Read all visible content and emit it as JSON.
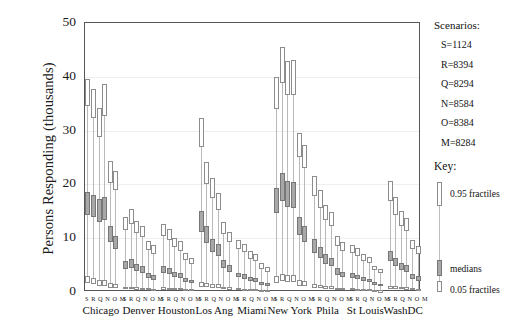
{
  "chart_data": {
    "type": "box",
    "title": "",
    "xlabel": "",
    "ylabel": "Persons Responding (thousands)",
    "ylim": [
      0,
      50
    ],
    "yticks": [
      0,
      10,
      20,
      30,
      40,
      50
    ],
    "grid": true,
    "legend_position": "right",
    "categories": [
      "Chicago",
      "Denver",
      "Houston",
      "Los Ang",
      "Miami",
      "New York",
      "Phila",
      "St Louis",
      "WashDC"
    ],
    "scenario_order": [
      "S",
      "R",
      "Q",
      "N",
      "O",
      "M"
    ],
    "scenario_label_text": "S R Q N O M",
    "groups": [
      {
        "city": "Chicago",
        "bars": [
          {
            "scenario": "S",
            "p05": 1.6,
            "median": 16.5,
            "p95": 39.6,
            "q_lo": 34.5,
            "m_lo": 14.3,
            "m_hi": 18.6,
            "p05_hi": 2.9
          },
          {
            "scenario": "R",
            "p05": 1.4,
            "median": 16.0,
            "p95": 37.8,
            "q_lo": 32.4,
            "m_lo": 14.0,
            "m_hi": 18.1,
            "p05_hi": 2.6
          },
          {
            "scenario": "Q",
            "p05": 1.2,
            "median": 15.2,
            "p95": 34.2,
            "q_lo": 28.9,
            "m_lo": 13.0,
            "m_hi": 17.3,
            "p05_hi": 2.3
          },
          {
            "scenario": "N",
            "p05": 1.1,
            "median": 15.6,
            "p95": 38.6,
            "q_lo": 32.7,
            "m_lo": 13.4,
            "m_hi": 17.6,
            "p05_hi": 2.2
          },
          {
            "scenario": "O",
            "p05": 0.8,
            "median": 10.6,
            "p95": 24.3,
            "q_lo": 20.2,
            "m_lo": 9.2,
            "m_hi": 12.2,
            "p05_hi": 1.7
          },
          {
            "scenario": "M",
            "p05": 0.7,
            "median": 9.0,
            "p95": 22.4,
            "q_lo": 19.0,
            "m_lo": 7.9,
            "m_hi": 10.4,
            "p05_hi": 1.5
          }
        ]
      },
      {
        "city": "Denver",
        "bars": [
          {
            "scenario": "S",
            "p05": 0.5,
            "median": 5.0,
            "p95": 14.0,
            "q_lo": 11.5,
            "m_lo": 4.2,
            "m_hi": 5.8,
            "p05_hi": 1.0
          },
          {
            "scenario": "R",
            "p05": 0.5,
            "median": 5.3,
            "p95": 15.4,
            "q_lo": 12.6,
            "m_lo": 4.5,
            "m_hi": 6.1,
            "p05_hi": 1.0
          },
          {
            "scenario": "Q",
            "p05": 0.4,
            "median": 4.5,
            "p95": 13.2,
            "q_lo": 10.9,
            "m_lo": 3.9,
            "m_hi": 5.2,
            "p05_hi": 0.9
          },
          {
            "scenario": "N",
            "p05": 0.4,
            "median": 4.1,
            "p95": 12.3,
            "q_lo": 10.2,
            "m_lo": 3.5,
            "m_hi": 4.8,
            "p05_hi": 0.8
          },
          {
            "scenario": "O",
            "p05": 0.3,
            "median": 3.0,
            "p95": 9.5,
            "q_lo": 7.8,
            "m_lo": 2.6,
            "m_hi": 3.5,
            "p05_hi": 0.7
          },
          {
            "scenario": "M",
            "p05": 0.3,
            "median": 2.7,
            "p95": 8.7,
            "q_lo": 7.1,
            "m_lo": 2.3,
            "m_hi": 3.1,
            "p05_hi": 0.6
          }
        ]
      },
      {
        "city": "Houston",
        "bars": [
          {
            "scenario": "S",
            "p05": 0.4,
            "median": 4.2,
            "p95": 12.6,
            "q_lo": 10.4,
            "m_lo": 3.6,
            "m_hi": 4.9,
            "p05_hi": 0.9
          },
          {
            "scenario": "R",
            "p05": 0.4,
            "median": 3.9,
            "p95": 11.8,
            "q_lo": 9.7,
            "m_lo": 3.3,
            "m_hi": 4.5,
            "p05_hi": 0.8
          },
          {
            "scenario": "Q",
            "p05": 0.3,
            "median": 3.3,
            "p95": 10.1,
            "q_lo": 8.3,
            "m_lo": 2.8,
            "m_hi": 3.8,
            "p05_hi": 0.7
          },
          {
            "scenario": "N",
            "p05": 0.3,
            "median": 3.0,
            "p95": 9.4,
            "q_lo": 7.7,
            "m_lo": 2.6,
            "m_hi": 3.5,
            "p05_hi": 0.7
          },
          {
            "scenario": "O",
            "p05": 0.2,
            "median": 2.2,
            "p95": 7.2,
            "q_lo": 5.9,
            "m_lo": 1.9,
            "m_hi": 2.6,
            "p05_hi": 0.5
          },
          {
            "scenario": "M",
            "p05": 0.2,
            "median": 1.9,
            "p95": 6.4,
            "q_lo": 5.2,
            "m_lo": 1.6,
            "m_hi": 2.2,
            "p05_hi": 0.5
          }
        ]
      },
      {
        "city": "Los Ang",
        "bars": [
          {
            "scenario": "S",
            "p05": 1.0,
            "median": 13.0,
            "p95": 32.3,
            "q_lo": 27.0,
            "m_lo": 11.2,
            "m_hi": 15.0,
            "p05_hi": 1.9
          },
          {
            "scenario": "R",
            "p05": 0.9,
            "median": 10.6,
            "p95": 24.2,
            "q_lo": 20.1,
            "m_lo": 9.1,
            "m_hi": 12.2,
            "p05_hi": 1.7
          },
          {
            "scenario": "Q",
            "p05": 0.8,
            "median": 8.6,
            "p95": 21.1,
            "q_lo": 17.5,
            "m_lo": 7.4,
            "m_hi": 9.9,
            "p05_hi": 1.5
          },
          {
            "scenario": "N",
            "p05": 0.7,
            "median": 7.8,
            "p95": 18.4,
            "q_lo": 15.2,
            "m_lo": 6.7,
            "m_hi": 9.0,
            "p05_hi": 1.4
          },
          {
            "scenario": "O",
            "p05": 0.5,
            "median": 5.2,
            "p95": 13.0,
            "q_lo": 10.7,
            "m_lo": 4.4,
            "m_hi": 6.0,
            "p05_hi": 1.0
          },
          {
            "scenario": "M",
            "p05": 0.4,
            "median": 4.4,
            "p95": 11.2,
            "q_lo": 9.2,
            "m_lo": 3.8,
            "m_hi": 5.1,
            "p05_hi": 0.9
          }
        ]
      },
      {
        "city": "Miami",
        "bars": [
          {
            "scenario": "S",
            "p05": 0.3,
            "median": 3.1,
            "p95": 9.6,
            "q_lo": 7.9,
            "m_lo": 2.7,
            "m_hi": 3.6,
            "p05_hi": 0.7
          },
          {
            "scenario": "R",
            "p05": 0.3,
            "median": 2.9,
            "p95": 9.0,
            "q_lo": 7.4,
            "m_lo": 2.5,
            "m_hi": 3.4,
            "p05_hi": 0.6
          },
          {
            "scenario": "Q",
            "p05": 0.2,
            "median": 2.4,
            "p95": 7.6,
            "q_lo": 6.2,
            "m_lo": 2.0,
            "m_hi": 2.8,
            "p05_hi": 0.6
          },
          {
            "scenario": "N",
            "p05": 0.2,
            "median": 2.2,
            "p95": 7.0,
            "q_lo": 5.7,
            "m_lo": 1.9,
            "m_hi": 2.6,
            "p05_hi": 0.5
          },
          {
            "scenario": "O",
            "p05": 0.2,
            "median": 1.6,
            "p95": 5.3,
            "q_lo": 4.3,
            "m_lo": 1.3,
            "m_hi": 1.9,
            "p05_hi": 0.4
          },
          {
            "scenario": "M",
            "p05": 0.1,
            "median": 1.4,
            "p95": 4.7,
            "q_lo": 3.8,
            "m_lo": 1.2,
            "m_hi": 1.7,
            "p05_hi": 0.4
          }
        ]
      },
      {
        "city": "New York",
        "bars": [
          {
            "scenario": "S",
            "p05": 1.7,
            "median": 17.0,
            "p95": 39.9,
            "q_lo": 34.0,
            "m_lo": 14.7,
            "m_hi": 19.3,
            "p05_hi": 3.0
          },
          {
            "scenario": "R",
            "p05": 2.0,
            "median": 19.6,
            "p95": 45.6,
            "q_lo": 38.9,
            "m_lo": 17.0,
            "m_hi": 22.2,
            "p05_hi": 3.4
          },
          {
            "scenario": "Q",
            "p05": 1.8,
            "median": 18.2,
            "p95": 43.0,
            "q_lo": 36.6,
            "m_lo": 15.8,
            "m_hi": 20.6,
            "p05_hi": 3.1
          },
          {
            "scenario": "N",
            "p05": 1.8,
            "median": 18.1,
            "p95": 43.1,
            "q_lo": 36.7,
            "m_lo": 15.7,
            "m_hi": 20.5,
            "p05_hi": 3.1
          },
          {
            "scenario": "O",
            "p05": 1.2,
            "median": 12.3,
            "p95": 29.6,
            "q_lo": 25.0,
            "m_lo": 10.6,
            "m_hi": 14.0,
            "p05_hi": 2.2
          },
          {
            "scenario": "M",
            "p05": 1.1,
            "median": 10.8,
            "p95": 27.4,
            "q_lo": 23.0,
            "m_lo": 9.3,
            "m_hi": 12.3,
            "p05_hi": 2.0
          }
        ]
      },
      {
        "city": "Phila",
        "bars": [
          {
            "scenario": "S",
            "p05": 0.8,
            "median": 8.5,
            "p95": 21.6,
            "q_lo": 17.8,
            "m_lo": 7.3,
            "m_hi": 9.8,
            "p05_hi": 1.5
          },
          {
            "scenario": "R",
            "p05": 0.7,
            "median": 7.3,
            "p95": 19.0,
            "q_lo": 15.6,
            "m_lo": 6.3,
            "m_hi": 8.4,
            "p05_hi": 1.3
          },
          {
            "scenario": "Q",
            "p05": 0.6,
            "median": 6.1,
            "p95": 16.2,
            "q_lo": 13.3,
            "m_lo": 5.2,
            "m_hi": 7.0,
            "p05_hi": 1.1
          },
          {
            "scenario": "N",
            "p05": 0.6,
            "median": 5.6,
            "p95": 14.9,
            "q_lo": 12.2,
            "m_lo": 4.8,
            "m_hi": 6.4,
            "p05_hi": 1.1
          },
          {
            "scenario": "O",
            "p05": 0.4,
            "median": 3.8,
            "p95": 10.5,
            "q_lo": 8.6,
            "m_lo": 3.2,
            "m_hi": 4.4,
            "p05_hi": 0.8
          },
          {
            "scenario": "M",
            "p05": 0.4,
            "median": 3.3,
            "p95": 9.3,
            "q_lo": 7.6,
            "m_lo": 2.8,
            "m_hi": 3.8,
            "p05_hi": 0.7
          }
        ]
      },
      {
        "city": "St Louis",
        "bars": [
          {
            "scenario": "S",
            "p05": 0.3,
            "median": 3.0,
            "p95": 8.8,
            "q_lo": 7.2,
            "m_lo": 2.6,
            "m_hi": 3.5,
            "p05_hi": 0.7
          },
          {
            "scenario": "R",
            "p05": 0.3,
            "median": 2.8,
            "p95": 8.2,
            "q_lo": 6.7,
            "m_lo": 2.4,
            "m_hi": 3.2,
            "p05_hi": 0.6
          },
          {
            "scenario": "Q",
            "p05": 0.2,
            "median": 2.3,
            "p95": 7.0,
            "q_lo": 5.7,
            "m_lo": 2.0,
            "m_hi": 2.7,
            "p05_hi": 0.5
          },
          {
            "scenario": "N",
            "p05": 0.2,
            "median": 2.1,
            "p95": 6.5,
            "q_lo": 5.3,
            "m_lo": 1.8,
            "m_hi": 2.4,
            "p05_hi": 0.5
          },
          {
            "scenario": "O",
            "p05": 0.2,
            "median": 1.5,
            "p95": 4.9,
            "q_lo": 4.0,
            "m_lo": 1.3,
            "m_hi": 1.8,
            "p05_hi": 0.4
          },
          {
            "scenario": "M",
            "p05": 0.1,
            "median": 1.3,
            "p95": 4.3,
            "q_lo": 3.5,
            "m_lo": 1.1,
            "m_hi": 1.5,
            "p05_hi": 0.3
          }
        ]
      },
      {
        "city": "WashDC",
        "bars": [
          {
            "scenario": "S",
            "p05": 0.6,
            "median": 6.6,
            "p95": 20.6,
            "q_lo": 17.0,
            "m_lo": 5.7,
            "m_hi": 7.6,
            "p05_hi": 1.2
          },
          {
            "scenario": "R",
            "p05": 0.5,
            "median": 5.6,
            "p95": 17.6,
            "q_lo": 14.4,
            "m_lo": 4.8,
            "m_hi": 6.4,
            "p05_hi": 1.1
          },
          {
            "scenario": "Q",
            "p05": 0.5,
            "median": 4.7,
            "p95": 15.1,
            "q_lo": 12.3,
            "m_lo": 4.0,
            "m_hi": 5.4,
            "p05_hi": 0.9
          },
          {
            "scenario": "N",
            "p05": 0.4,
            "median": 4.3,
            "p95": 13.8,
            "q_lo": 11.3,
            "m_lo": 3.7,
            "m_hi": 5.0,
            "p05_hi": 0.9
          },
          {
            "scenario": "O",
            "p05": 0.3,
            "median": 2.9,
            "p95": 9.7,
            "q_lo": 7.9,
            "m_lo": 2.5,
            "m_hi": 3.4,
            "p05_hi": 0.7
          },
          {
            "scenario": "M",
            "p05": 0.3,
            "median": 2.5,
            "p95": 8.6,
            "q_lo": 7.0,
            "m_lo": 2.1,
            "m_hi": 2.9,
            "p05_hi": 0.6
          }
        ]
      }
    ]
  },
  "legend": {
    "title": "Scenarios:",
    "entries": [
      "S=1124",
      "R=8394",
      "Q=8294",
      "N=8584",
      "O=8384",
      "M=8284"
    ]
  },
  "key": {
    "title": "Key:",
    "upper_label": "0.95 fractiles",
    "middle_label": "medians",
    "lower_label": "0.05 fractiles"
  },
  "colors": {
    "frame": "#555555",
    "grid": "#efefef",
    "stem": "#b9b9b9",
    "box_outline": "#8c8c8c",
    "median_fill": "#a8a8a8",
    "background": "#ffffff"
  }
}
